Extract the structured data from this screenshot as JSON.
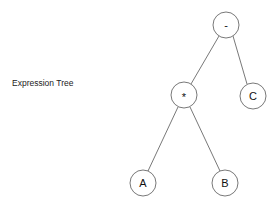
{
  "title": "Expression Tree",
  "tree": {
    "nodes": [
      {
        "id": "root",
        "label": "-",
        "cx": 226,
        "cy": 25,
        "r": 13
      },
      {
        "id": "mul",
        "label": "*",
        "cx": 184,
        "cy": 95,
        "r": 13
      },
      {
        "id": "c",
        "label": "C",
        "cx": 253,
        "cy": 96,
        "r": 13
      },
      {
        "id": "a",
        "label": "A",
        "cx": 143,
        "cy": 183,
        "r": 13
      },
      {
        "id": "b",
        "label": "B",
        "cx": 225,
        "cy": 183,
        "r": 13
      }
    ],
    "edges": [
      {
        "from": "root",
        "to": "mul"
      },
      {
        "from": "root",
        "to": "c"
      },
      {
        "from": "mul",
        "to": "a"
      },
      {
        "from": "mul",
        "to": "b"
      }
    ]
  },
  "colors": {
    "stroke": "#555555",
    "text": "#111111",
    "background": "#ffffff"
  }
}
